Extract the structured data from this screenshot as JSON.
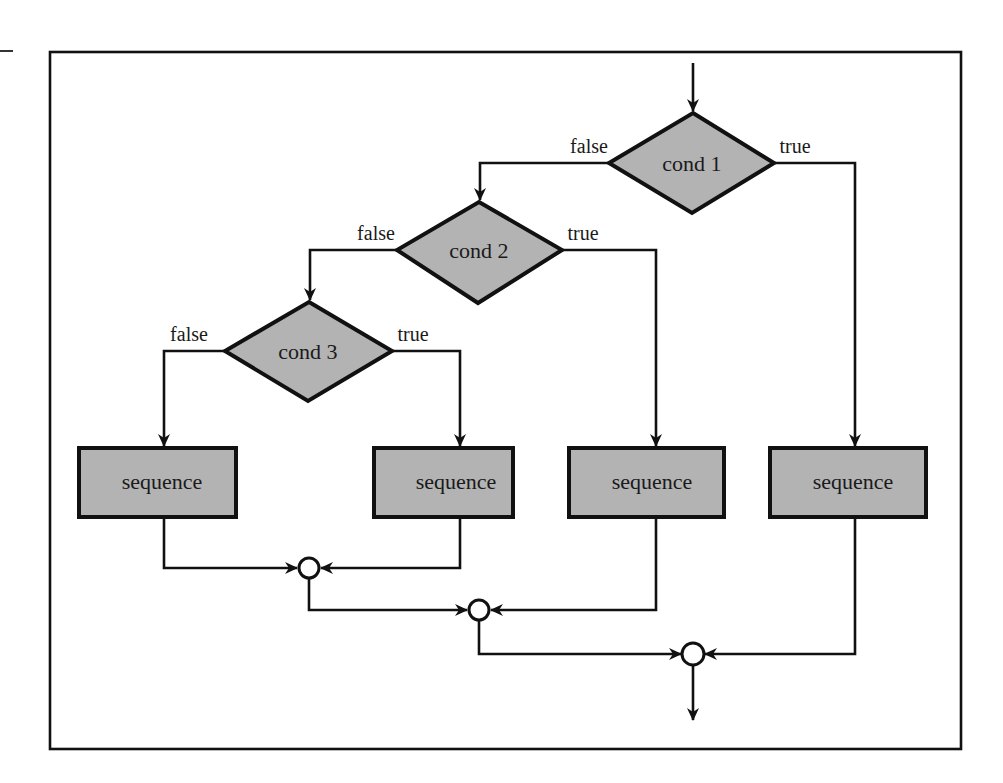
{
  "diagram": {
    "type": "flowchart",
    "colors": {
      "node_fill": "#b3b3b3",
      "stroke": "#111111",
      "connector_fill": "#ffffff",
      "background": "#ffffff"
    },
    "decisions": [
      {
        "id": "cond1",
        "label": "cond 1",
        "false_label": "false",
        "true_label": "true"
      },
      {
        "id": "cond2",
        "label": "cond 2",
        "false_label": "false",
        "true_label": "true"
      },
      {
        "id": "cond3",
        "label": "cond 3",
        "false_label": "false",
        "true_label": "true"
      }
    ],
    "sequences": [
      {
        "id": "seq1",
        "label": "sequence",
        "from": "cond3 false"
      },
      {
        "id": "seq2",
        "label": "sequence",
        "from": "cond3 true"
      },
      {
        "id": "seq3",
        "label": "sequence",
        "from": "cond2 true"
      },
      {
        "id": "seq4",
        "label": "sequence",
        "from": "cond1 true"
      }
    ],
    "connectors": [
      {
        "id": "join1",
        "inputs": [
          "seq1",
          "seq2"
        ]
      },
      {
        "id": "join2",
        "inputs": [
          "join1",
          "seq3"
        ]
      },
      {
        "id": "join3",
        "inputs": [
          "join2",
          "seq4"
        ]
      }
    ],
    "edges": [
      [
        "entry",
        "cond1"
      ],
      [
        "cond1",
        "cond2",
        "false"
      ],
      [
        "cond1",
        "seq4",
        "true"
      ],
      [
        "cond2",
        "cond3",
        "false"
      ],
      [
        "cond2",
        "seq3",
        "true"
      ],
      [
        "cond3",
        "seq1",
        "false"
      ],
      [
        "cond3",
        "seq2",
        "true"
      ],
      [
        "seq1",
        "join1"
      ],
      [
        "seq2",
        "join1"
      ],
      [
        "join1",
        "join2"
      ],
      [
        "seq3",
        "join2"
      ],
      [
        "join2",
        "join3"
      ],
      [
        "seq4",
        "join3"
      ],
      [
        "join3",
        "exit"
      ]
    ]
  }
}
